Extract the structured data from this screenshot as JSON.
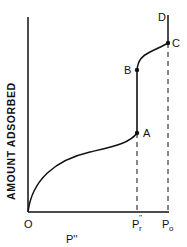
{
  "diagram": {
    "type": "adsorption-isotherm",
    "y_axis_label": "AMOUNT ADSORBED",
    "x_axis_label": "P''",
    "origin_label": "O",
    "x_ticks": [
      {
        "label_main": "P",
        "label_sup": "''",
        "label_sub": "r",
        "position": "Pr''"
      },
      {
        "label_main": "P",
        "label_sub": "o",
        "position": "Po"
      }
    ],
    "points": [
      {
        "label": "A"
      },
      {
        "label": "B"
      },
      {
        "label": "C"
      },
      {
        "label": "D"
      }
    ],
    "colors": {
      "ink": "#111111",
      "background": "#ffffff"
    }
  }
}
